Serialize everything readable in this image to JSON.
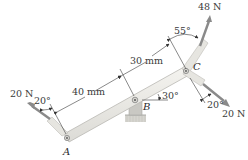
{
  "diagram": {
    "type": "free-body / bent lever with pin support",
    "points": {
      "A": {
        "label": "A"
      },
      "B": {
        "label": "B"
      },
      "C": {
        "label": "C"
      }
    },
    "forces": [
      {
        "id": "force-A",
        "label": "20 N",
        "angle_label": "20°",
        "at": "A"
      },
      {
        "id": "force-C-up",
        "label": "48 N",
        "angle_label": "55°",
        "at": "C"
      },
      {
        "id": "force-C-down",
        "label": "20 N",
        "angle_label": "20°",
        "at": "C"
      }
    ],
    "dimensions": [
      {
        "id": "dim-AB",
        "label": "40 mm"
      },
      {
        "id": "dim-BC",
        "label": "30 mm"
      }
    ],
    "inclination": {
      "label": "30°"
    },
    "colors": {
      "member_fill": "#ecebe6",
      "member_edge": "#b9b8b2",
      "arrow_fill": "#8a8a8a",
      "line": "#3a3a3a",
      "support": "#c9c8c3"
    }
  }
}
